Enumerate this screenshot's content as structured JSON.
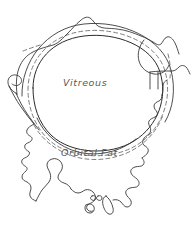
{
  "figure": {
    "background_color": "#ffffff",
    "width": 194,
    "height": 227
  },
  "style": {
    "ink_color": "#2b2b2b",
    "dashed_color": "#6e6e6e",
    "label_color": "#5a5a5a"
  },
  "labels": {
    "vitreous": {
      "text": "Vitreous",
      "x": 63,
      "y": 86
    },
    "orbital_fat": {
      "text": "Orbital Fat",
      "x": 61,
      "y": 156
    }
  },
  "regions": [
    {
      "name": "globe",
      "label": "Vitreous"
    },
    {
      "name": "retrobulbar-fat",
      "label": "Orbital Fat"
    }
  ]
}
